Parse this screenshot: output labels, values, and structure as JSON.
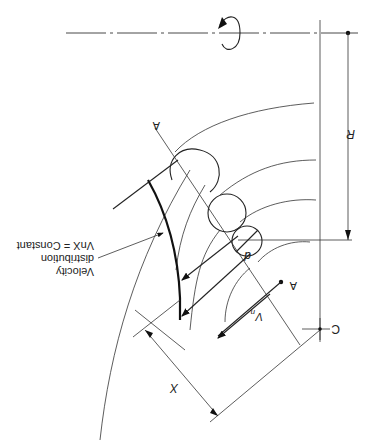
{
  "diagram": {
    "orientation": "rotated 180 degrees (upside down)",
    "labels": {
      "section_top": "A",
      "section_bottom": "A",
      "radius": "R",
      "center": "C",
      "distance": "X",
      "normal_velocity": "Vn",
      "normal_velocity_base": "V",
      "normal_velocity_sub": "n",
      "diameter": "d",
      "annotation_line1": "Velocity",
      "annotation_line2": "distribution",
      "annotation_line3": "VnX = Constant"
    },
    "elements": [
      "axis-of-rotation",
      "rotation-arrow",
      "streamline-arcs",
      "inscribed-circles",
      "section-line-A-A",
      "velocity-distribution-curve",
      "velocity-vectors",
      "dimension-R",
      "dimension-X",
      "center-mark-C"
    ]
  }
}
